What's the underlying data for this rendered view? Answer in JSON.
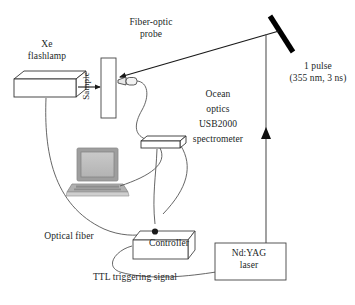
{
  "figure": {
    "type": "optical-setup-schematic",
    "background_color": "#ffffff",
    "ink_color": "#221f1f",
    "width": 355,
    "height": 305
  },
  "labels": {
    "xe_flashlamp": "Xe\nflashlamp",
    "fiber_optic_probe": "Fiber-optic\nprobe",
    "sample": "Sample",
    "one_pulse": "1 pulse\n(355 nm, 3 ns)",
    "spectrometer": "Ocean\noptics\nUSB2000\nspectrometer",
    "optical_fiber": "Optical fiber",
    "controller": "Controller",
    "ndyag_laser": "Nd:YAG\nlaser",
    "ttl_signal": "TTL triggering signal"
  },
  "components": [
    {
      "name": "xe-flashlamp",
      "shape": "3d-box"
    },
    {
      "name": "sample-cuvette",
      "shape": "rectangle"
    },
    {
      "name": "fiber-optic-probe-tip",
      "shape": "connector"
    },
    {
      "name": "mirror",
      "shape": "thick-diagonal-bar",
      "color": "#000000"
    },
    {
      "name": "usb2000-spectrometer",
      "shape": "3d-box"
    },
    {
      "name": "laptop-computer",
      "shape": "raster-illustration",
      "color": "#9a9a9a"
    },
    {
      "name": "controller",
      "shape": "3d-box"
    },
    {
      "name": "ndyag-laser",
      "shape": "rectangle"
    }
  ],
  "beams": [
    {
      "name": "flashlamp-to-sample",
      "style": "arrow",
      "direction": "right"
    },
    {
      "name": "laser-to-mirror",
      "style": "arrow-vertical",
      "direction": "up"
    },
    {
      "name": "mirror-to-sample",
      "style": "arrow-diagonal",
      "direction": "down-left"
    }
  ],
  "cables": [
    {
      "name": "probe-to-spectrometer"
    },
    {
      "name": "flashlamp-to-controller"
    },
    {
      "name": "spectrometer-to-laptop"
    },
    {
      "name": "spectrometer-to-controller"
    },
    {
      "name": "controller-to-ndyag-laser"
    }
  ]
}
